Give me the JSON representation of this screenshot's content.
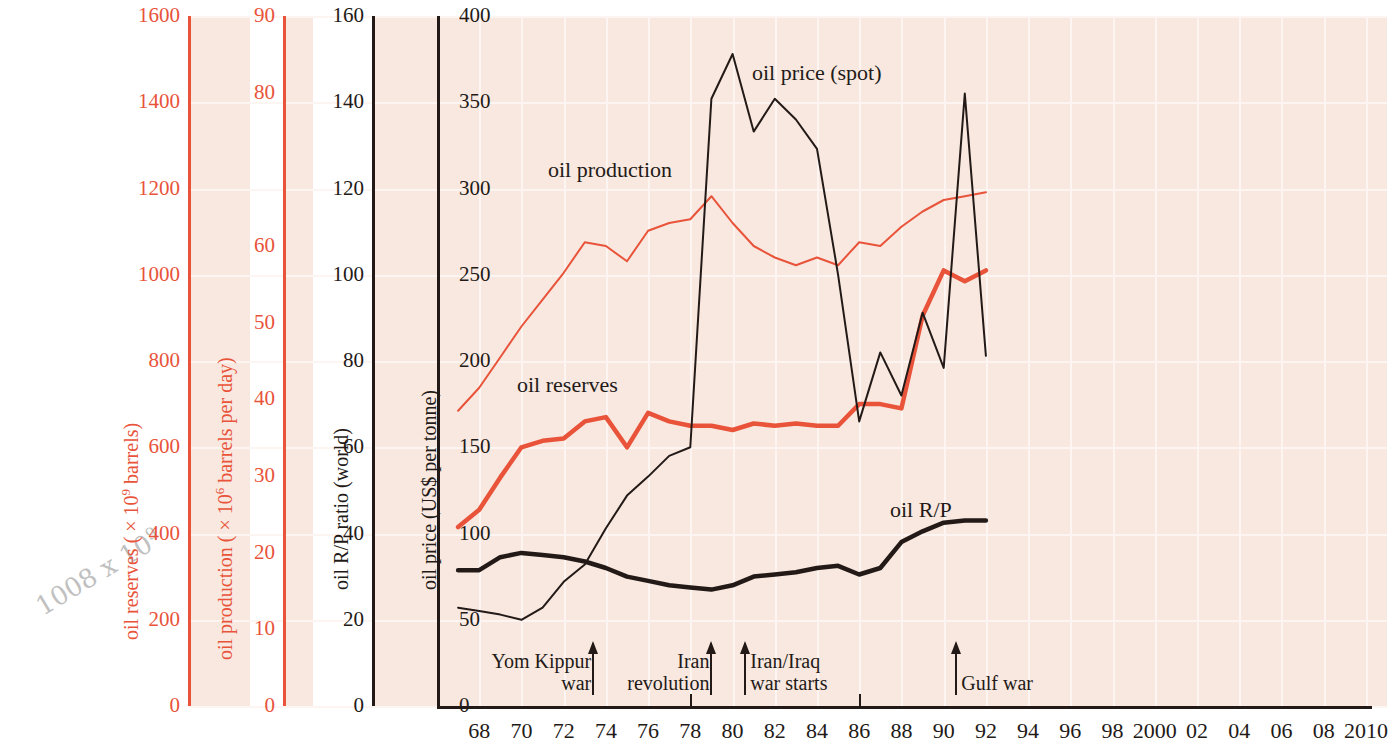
{
  "figure": {
    "background_color": "#f8e8df",
    "grid_color": "#fdf5f1",
    "red": "#e8533a",
    "dark": "#231a17"
  },
  "pencil_note": {
    "text": "1008 x 10",
    "exp": "9"
  },
  "axes": [
    {
      "id": "reserves",
      "title_pre": "oil reserves ( × 10",
      "title_sup": "9",
      "title_post": " barrels)",
      "color": "#e8533a",
      "ticks": [
        "1600",
        "1400",
        "1200",
        "1000",
        "800",
        "600",
        "400",
        "200",
        "0"
      ],
      "min": 0,
      "max": 1600,
      "step": 200
    },
    {
      "id": "production",
      "title_pre": "oil production ( × 10",
      "title_sup": "6",
      "title_post": " barrels per day)",
      "color": "#e8533a",
      "ticks": [
        "90",
        "80",
        "",
        "60",
        "50",
        "40",
        "30",
        "20",
        "10",
        "0"
      ],
      "min": 0,
      "max": 90,
      "step": 10
    },
    {
      "id": "rp",
      "title_pre": "oil R/P ratio (world)",
      "title_sup": "",
      "title_post": "",
      "color": "#231a17",
      "ticks": [
        "160",
        "140",
        "120",
        "100",
        "80",
        "60",
        "40",
        "20",
        "0"
      ],
      "min": 0,
      "max": 160,
      "step": 20
    },
    {
      "id": "price",
      "title_pre": "oil price (US$ per tonne)",
      "title_sup": "",
      "title_post": "",
      "color": "#231a17",
      "ticks": [
        "400",
        "350",
        "300",
        "250",
        "200",
        "150",
        "100",
        "50",
        "0"
      ],
      "min": 0,
      "max": 400,
      "step": 50
    }
  ],
  "xaxis": {
    "labels": [
      "68",
      "70",
      "72",
      "74",
      "76",
      "78",
      "80",
      "82",
      "84",
      "86",
      "88",
      "90",
      "92",
      "94",
      "96",
      "98",
      "2000",
      "02",
      "04",
      "06",
      "08",
      "2010"
    ],
    "years": [
      1968,
      1970,
      1972,
      1974,
      1976,
      1978,
      1980,
      1982,
      1984,
      1986,
      1988,
      1990,
      1992,
      1994,
      1996,
      1998,
      2000,
      2002,
      2004,
      2006,
      2008,
      2010
    ],
    "min": 1966,
    "max": 2011,
    "tickmark_years": [
      1978,
      1986
    ]
  },
  "series_labels": [
    {
      "name": "oil-price-spot",
      "text": "oil price (spot)"
    },
    {
      "name": "oil-production",
      "text": "oil production"
    },
    {
      "name": "oil-reserves",
      "text": "oil reserves"
    },
    {
      "name": "oil-rp",
      "text": "oil R/P"
    }
  ],
  "events": [
    {
      "name": "yom-kippur-war",
      "line1": "Yom Kippur",
      "line2": "war",
      "year": 1973.4,
      "align": "right"
    },
    {
      "name": "iran-revolution",
      "line1": "Iran",
      "line2": "revolution",
      "year": 1979.0,
      "align": "right"
    },
    {
      "name": "iran-iraq-war-starts",
      "line1": "Iran/Iraq",
      "line2": "war starts",
      "year": 1980.6,
      "align": "left"
    },
    {
      "name": "gulf-war",
      "line1": "",
      "line2": "Gulf war",
      "year": 1990.6,
      "align": "left"
    }
  ],
  "chart_data": {
    "type": "line",
    "title": "",
    "xlabel": "",
    "grid": true,
    "legend": "inline-labels",
    "xlim": [
      1966,
      2011
    ],
    "series": [
      {
        "name": "oil reserves",
        "axis": "reserves",
        "unit": "× 10^9 barrels",
        "color": "#e8533a",
        "width": 4.5,
        "ylim": [
          0,
          1600
        ],
        "x": [
          1967,
          1968,
          1969,
          1970,
          1971,
          1972,
          1973,
          1974,
          1975,
          1976,
          1977,
          1978,
          1979,
          1980,
          1981,
          1982,
          1983,
          1984,
          1985,
          1986,
          1987,
          1988,
          1989,
          1990,
          1991,
          1992
        ],
        "y": [
          415,
          455,
          530,
          600,
          615,
          620,
          660,
          670,
          600,
          680,
          660,
          650,
          650,
          640,
          655,
          650,
          655,
          650,
          650,
          700,
          700,
          690,
          905,
          1010,
          985,
          1010
        ]
      },
      {
        "name": "oil production",
        "axis": "production",
        "unit": "× 10^6 barrels per day",
        "color": "#e8533a",
        "width": 2,
        "ylim": [
          0,
          90
        ],
        "x": [
          1967,
          1968,
          1969,
          1970,
          1971,
          1972,
          1973,
          1974,
          1975,
          1976,
          1977,
          1978,
          1979,
          1980,
          1981,
          1982,
          1983,
          1984,
          1985,
          1986,
          1987,
          1988,
          1989,
          1990,
          1991,
          1992
        ],
        "y": [
          38.5,
          41.5,
          45.5,
          49.5,
          53.0,
          56.5,
          60.5,
          60.0,
          58.0,
          62.0,
          63.0,
          63.5,
          66.5,
          63.0,
          60.0,
          58.5,
          57.5,
          58.5,
          57.5,
          60.5,
          60.0,
          62.5,
          64.5,
          66.0,
          66.5,
          67.0
        ]
      },
      {
        "name": "oil R/P",
        "axis": "rp",
        "unit": "years",
        "color": "#231a17",
        "width": 4.5,
        "ylim": [
          0,
          160
        ],
        "x": [
          1967,
          1968,
          1969,
          1970,
          1971,
          1972,
          1973,
          1974,
          1975,
          1976,
          1977,
          1978,
          1979,
          1980,
          1981,
          1982,
          1983,
          1984,
          1985,
          1986,
          1987,
          1988,
          1989,
          1990,
          1991,
          1992
        ],
        "y": [
          31.5,
          31.5,
          34.5,
          35.5,
          35.0,
          34.5,
          33.5,
          32.0,
          30.0,
          29.0,
          28.0,
          27.5,
          27.0,
          28.0,
          30.0,
          30.5,
          31.0,
          32.0,
          32.5,
          30.5,
          32.0,
          38.0,
          40.5,
          42.5,
          43.0,
          43.0
        ]
      },
      {
        "name": "oil price (spot)",
        "axis": "price",
        "unit": "US$ per tonne",
        "color": "#231a17",
        "width": 2,
        "ylim": [
          0,
          400
        ],
        "x": [
          1967,
          1968,
          1969,
          1970,
          1971,
          1972,
          1973,
          1974,
          1975,
          1976,
          1977,
          1978,
          1979,
          1980,
          1981,
          1982,
          1983,
          1984,
          1985,
          1986,
          1987,
          1988,
          1989,
          1990,
          1991,
          1992
        ],
        "y": [
          57,
          55,
          53,
          50,
          57,
          72,
          82,
          103,
          122,
          133,
          145,
          150,
          352,
          378,
          333,
          352,
          340,
          323,
          250,
          165,
          205,
          180,
          228,
          196,
          355,
          203
        ]
      }
    ]
  }
}
